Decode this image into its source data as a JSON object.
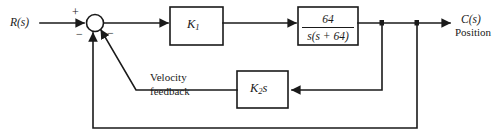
{
  "diagram": {
    "type": "control-system-block-diagram",
    "title": "",
    "background_color": "#ffffff",
    "line_color": "#1a1a1a",
    "input": {
      "label": "R(s)"
    },
    "output": {
      "label": "C(s)",
      "sublabel": "Position"
    },
    "summing_junction": {
      "sign_input": "+",
      "sign_position_feedback": "−",
      "sign_velocity_feedback": "−"
    },
    "blocks": [
      {
        "id": "gain",
        "label": "K",
        "subscript": "1"
      },
      {
        "id": "plant",
        "numerator": "64",
        "denominator": "s(s + 64)"
      },
      {
        "id": "rate",
        "label": "K",
        "subscript": "2",
        "suffix": "s"
      }
    ],
    "annotations": {
      "velocity_feedback_line1": "Velocity",
      "velocity_feedback_line2": "feedback"
    }
  }
}
